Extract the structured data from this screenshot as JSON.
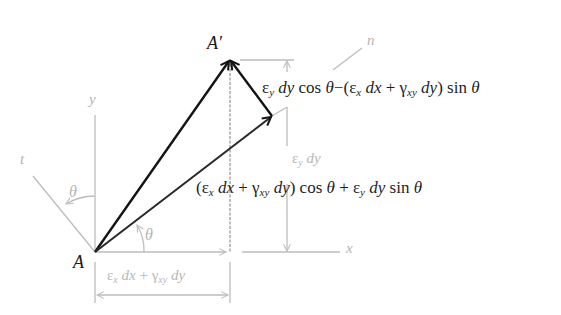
{
  "diagram": {
    "type": "strain-displacement geometry",
    "colors": {
      "primary_stroke": "#141414",
      "secondary_stroke": "#2a2a2a",
      "construction_stroke": "#bdbdbd",
      "background": "#ffffff"
    },
    "points": {
      "origin_label": "A",
      "displaced_label": "A′"
    },
    "axes": {
      "x_label": "x",
      "y_label": "y",
      "n_label": "n",
      "t_label": "t"
    },
    "angles": {
      "theta_at_x": "θ",
      "theta_at_y": "θ"
    },
    "expressions": {
      "top": {
        "eps": "ε",
        "eps_sub": "y",
        "d1": "dy",
        "cos": "cos",
        "theta1": "θ",
        "minus": "−",
        "open": "(",
        "eps2": "ε",
        "eps2_sub": "x",
        "dx": "dx",
        "plus": "+",
        "gamma": "γ",
        "gamma_sub": "xy",
        "dy": "dy",
        "close": ")",
        "sin": "sin",
        "theta2": "θ"
      },
      "middle": {
        "open": "(",
        "eps": "ε",
        "eps_sub": "x",
        "dx": "dx",
        "plus": "+",
        "gamma": "γ",
        "gamma_sub": "xy",
        "dy": "dy",
        "close": ")",
        "cos": "cos",
        "theta1": "θ",
        "plus2": "+",
        "eps2": "ε",
        "eps2_sub": "y",
        "dy2": "dy",
        "sin": "sin",
        "theta2": "θ"
      },
      "vertical_dim": {
        "eps": "ε",
        "eps_sub": "y",
        "dy": "dy"
      },
      "horizontal_dim": {
        "eps": "ε",
        "eps_sub": "x",
        "dx": "dx",
        "plus": "+",
        "gamma": "γ",
        "gamma_sub": "xy",
        "dy": "dy"
      }
    }
  }
}
